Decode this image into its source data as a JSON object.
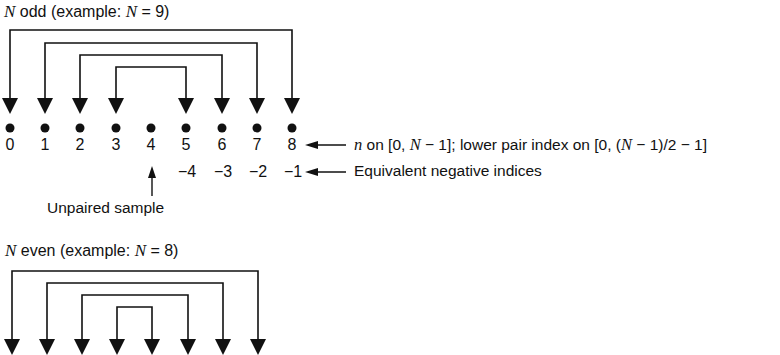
{
  "odd": {
    "title_var": "N",
    "title_text": " odd (example: ",
    "title_var2": "N",
    "title_end": " = 9)",
    "indices": [
      "0",
      "1",
      "2",
      "3",
      "4",
      "5",
      "6",
      "7",
      "8"
    ],
    "negative_indices": [
      "−4",
      "−3",
      "−2",
      "−1"
    ],
    "pairs": [
      [
        0,
        8
      ],
      [
        1,
        7
      ],
      [
        2,
        6
      ],
      [
        3,
        5
      ]
    ],
    "unpaired_index": 4,
    "annotation_n_var": "n",
    "annotation_n_text": " on [0, ",
    "annotation_n_var2": "N",
    "annotation_n_text2": " − 1]; lower pair index on [0, (",
    "annotation_n_var3": "N",
    "annotation_n_text3": " − 1)/2 − 1]",
    "annotation_negative": "Equivalent negative indices",
    "annotation_unpaired": "Unpaired sample"
  },
  "even": {
    "title_var": "N",
    "title_text": " even (example: ",
    "title_var2": "N",
    "title_end": " = 8)",
    "pairs": [
      [
        0,
        7
      ],
      [
        1,
        6
      ],
      [
        2,
        5
      ],
      [
        3,
        4
      ]
    ]
  },
  "colors": {
    "ink": "#111111",
    "background": "#ffffff"
  }
}
